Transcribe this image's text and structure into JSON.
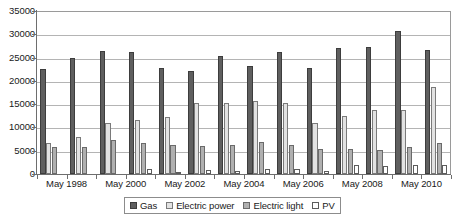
{
  "chart_data": {
    "type": "bar",
    "title": "",
    "subtitle": "",
    "xlabel": "",
    "ylabel": "",
    "ylim": [
      0,
      35000
    ],
    "ytick_labels": [
      "0",
      "5000",
      "10000",
      "15000",
      "20000",
      "25000",
      "30000",
      "35000"
    ],
    "ytick_values": [
      0,
      5000,
      10000,
      15000,
      20000,
      25000,
      30000,
      35000
    ],
    "grid": true,
    "legend_position": "bottom",
    "categories": [
      "May 1998",
      "May 1999",
      "May 2000",
      "May 2001",
      "May 2002",
      "May 2003",
      "May 2004",
      "May 2005",
      "May 2006",
      "May 2007",
      "May 2008",
      "May 2009",
      "May 2010",
      "May 2011"
    ],
    "visible_xtick_labels": [
      "May 1998",
      "May 2000",
      "May 2002",
      "May 2004",
      "May 2006",
      "May 2008",
      "May 2010"
    ],
    "visible_xtick_indices": [
      0,
      2,
      4,
      6,
      8,
      10,
      12
    ],
    "series": [
      {
        "name": "Gas",
        "color": "#5f5f5f",
        "values": [
          22600,
          24900,
          26400,
          26100,
          22800,
          22100,
          25400,
          23200,
          26200,
          22800,
          27000,
          27200,
          30800,
          26600
        ]
      },
      {
        "name": "Electric power",
        "color": "#e2e2e2",
        "values": [
          6600,
          7900,
          10900,
          11500,
          12300,
          15200,
          15200,
          15600,
          15200,
          10900,
          12400,
          13800,
          13800,
          18700
        ]
      },
      {
        "name": "Electric light",
        "color": "#b0b0b0",
        "values": [
          5700,
          5900,
          7200,
          6600,
          6300,
          6100,
          6300,
          6800,
          6300,
          5400,
          5400,
          5100,
          5700,
          6700
        ]
      },
      {
        "name": "PV",
        "color": "#ffffff",
        "values": [
          0,
          0,
          0,
          1100,
          500,
          800,
          600,
          1000,
          1100,
          600,
          2000,
          1800,
          1900,
          1900
        ]
      }
    ]
  },
  "legend": {
    "items": [
      {
        "label": "Gas",
        "swatch": "s-gas"
      },
      {
        "label": "Electric power",
        "swatch": "s-electricpower"
      },
      {
        "label": "Electric light",
        "swatch": "s-electriclight"
      },
      {
        "label": "PV",
        "swatch": "s-pv"
      }
    ]
  }
}
